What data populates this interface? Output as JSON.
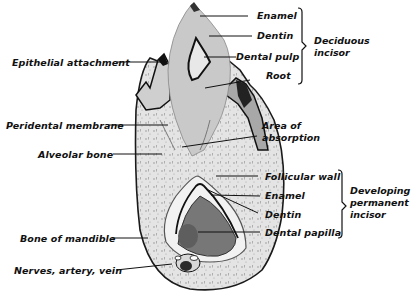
{
  "figure": {
    "labels_left": [
      {
        "id": "epithelial-attachment",
        "text": "Epithelial attachment"
      },
      {
        "id": "peridental-membrane",
        "text": "Peridental membrane"
      },
      {
        "id": "alveolar-bone",
        "text": "Alveolar bone"
      },
      {
        "id": "bone-of-mandible",
        "text": "Bone of mandible"
      },
      {
        "id": "nerves-artery-vein",
        "text": "Nerves, artery, vein"
      }
    ],
    "labels_right_top": [
      {
        "id": "enamel-deciduous",
        "text": "Enamel"
      },
      {
        "id": "dentin-deciduous",
        "text": "Dentin"
      },
      {
        "id": "dental-pulp",
        "text": "Dental pulp"
      },
      {
        "id": "root",
        "text": "Root"
      }
    ],
    "label_middle": {
      "id": "area-of-absorption",
      "lines": [
        "Area of",
        "absorption"
      ]
    },
    "labels_right_bottom": [
      {
        "id": "follicular-wall",
        "text": "Follicular wall"
      },
      {
        "id": "enamel-permanent",
        "text": "Enamel"
      },
      {
        "id": "dentin-permanent",
        "text": "Dentin"
      },
      {
        "id": "dental-papilla",
        "text": "Dental papilla"
      }
    ],
    "groups": [
      {
        "id": "deciduous-incisor",
        "lines": [
          "Deciduous",
          "incisor"
        ]
      },
      {
        "id": "developing-permanent-incisor",
        "lines": [
          "Developing",
          "permanent",
          "incisor"
        ]
      }
    ]
  }
}
